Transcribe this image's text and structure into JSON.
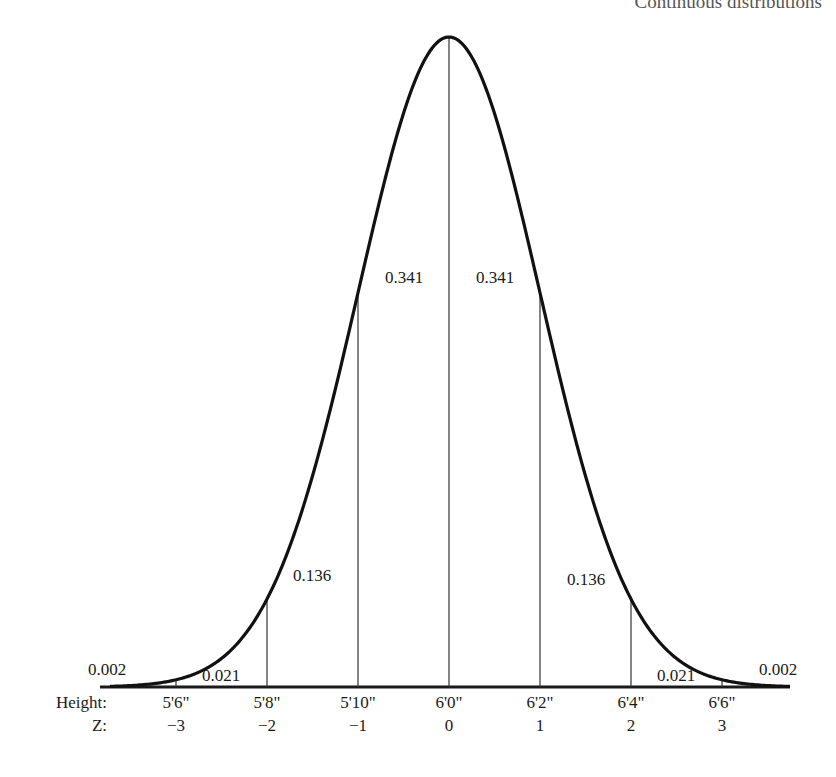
{
  "header": {
    "title": "Continuous distributions"
  },
  "chart_data": {
    "type": "area",
    "distribution": "normal",
    "mean": "6'0\"",
    "sd": "2\"",
    "xlabel_rows": [
      "Height:",
      "Z:"
    ],
    "height_ticks": [
      "5'6\"",
      "5'8\"",
      "5'10\"",
      "6'0\"",
      "6'2\"",
      "6'4\"",
      "6'6\""
    ],
    "z_ticks": [
      "−3",
      "−2",
      "−1",
      "0",
      "1",
      "2",
      "3"
    ],
    "regions": [
      {
        "range": "z < -3",
        "probability": "0.002"
      },
      {
        "range": "-3 to -2",
        "probability": "0.021"
      },
      {
        "range": "-2 to -1",
        "probability": "0.136"
      },
      {
        "range": "-1 to 0",
        "probability": "0.341"
      },
      {
        "range": "0 to 1",
        "probability": "0.341"
      },
      {
        "range": "1 to 2",
        "probability": "0.136"
      },
      {
        "range": "2 to 3",
        "probability": "0.021"
      },
      {
        "range": "z > 3",
        "probability": "0.002"
      }
    ],
    "grid": false,
    "legend": "none"
  }
}
